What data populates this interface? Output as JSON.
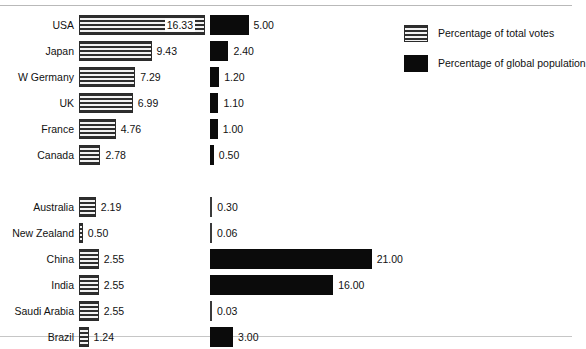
{
  "chart_data": {
    "type": "bar",
    "title": "",
    "xlabel": "",
    "ylabel": "",
    "orientation": "horizontal",
    "grid": false,
    "legend_position": "top-right",
    "axis_range": [
      0,
      21
    ],
    "px_per_unit": 7.7,
    "categories": [
      "USA",
      "Japan",
      "W Germany",
      "UK",
      "France",
      "Canada",
      "Australia",
      "New Zealand",
      "China",
      "India",
      "Saudi Arabia",
      "Brazil"
    ],
    "series": [
      {
        "name": "Percentage of total votes",
        "style": "striped",
        "values": [
          16.33,
          9.43,
          7.29,
          6.99,
          4.76,
          2.78,
          2.19,
          0.5,
          2.55,
          2.55,
          2.55,
          1.24
        ],
        "labels": [
          "16.33",
          "9.43",
          "7.29",
          "6.99",
          "4.76",
          "2.78",
          "2.19",
          "0.50",
          "2.55",
          "2.55",
          "2.55",
          "1.24"
        ]
      },
      {
        "name": "Percentage of global population",
        "style": "solid-black",
        "values": [
          5.0,
          2.4,
          1.2,
          1.1,
          1.0,
          0.5,
          0.3,
          0.06,
          21.0,
          16.0,
          0.03,
          3.0
        ],
        "labels": [
          "5.00",
          "2.40",
          "1.20",
          "1.10",
          "1.00",
          "0.50",
          "0.30",
          "0.06",
          "21.00",
          "16.00",
          "0.03",
          "3.00"
        ]
      }
    ],
    "groups": [
      {
        "name": "group-upper",
        "categories": [
          "USA",
          "Japan",
          "W Germany",
          "UK",
          "France",
          "Canada"
        ]
      },
      {
        "name": "group-lower",
        "categories": [
          "Australia",
          "New Zealand",
          "China",
          "India",
          "Saudi Arabia",
          "Brazil"
        ]
      }
    ]
  },
  "legend": {
    "items": [
      {
        "label": "Percentage of total votes",
        "style": "striped"
      },
      {
        "label": "Percentage of global population",
        "style": "solid-black"
      }
    ]
  },
  "colors": {
    "bar_solid": "#0b0b0b",
    "bar_stripe_dark": "#2e2e2e",
    "bar_stripe_light": "#f2f2f2",
    "text": "#111111",
    "rule": "#b9b9b9",
    "background": "#ffffff"
  }
}
